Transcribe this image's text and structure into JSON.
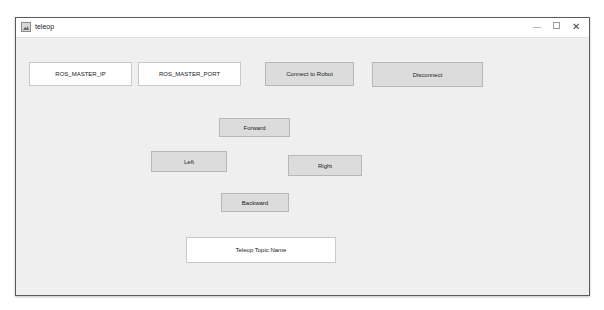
{
  "window": {
    "title": "teleop",
    "controls": {
      "minimize": "—",
      "maximize": "",
      "close": "✕"
    }
  },
  "connection": {
    "master_ip_field": {
      "value": "ROS_MASTER_IP"
    },
    "master_port_field": {
      "value": "ROS_MASTER_PORT"
    },
    "connect_label": "Connect to Robot",
    "disconnect_label": "Disconnect"
  },
  "drive": {
    "forward_label": "Forward",
    "left_label": "Left",
    "right_label": "Right",
    "backward_label": "Backward"
  },
  "topic": {
    "topic_field": {
      "value": "Teleop Topic Name"
    }
  },
  "colors": {
    "background": "#efefef",
    "button": "#dcdcdc",
    "field": "#ffffff"
  }
}
